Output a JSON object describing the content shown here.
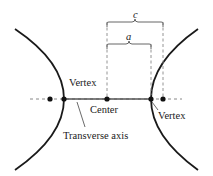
{
  "diagram": {
    "type": "hyperbola",
    "labels": {
      "left_vertex": "Vertex",
      "right_vertex": "Vertex",
      "center": "Center",
      "transverse_axis": "Transverse axis",
      "c": "c",
      "a": "a"
    },
    "points": [
      {
        "name": "left-focus",
        "x": 50,
        "y": 99
      },
      {
        "name": "left-vertex",
        "x": 64,
        "y": 99
      },
      {
        "name": "center",
        "x": 107,
        "y": 99
      },
      {
        "name": "right-vertex",
        "x": 151,
        "y": 99
      },
      {
        "name": "right-focus",
        "x": 163,
        "y": 99
      }
    ],
    "colors": {
      "curve": "#1a1a1a",
      "axis": "#555555",
      "dashed": "#888888",
      "text": "#1a1a1a"
    }
  }
}
